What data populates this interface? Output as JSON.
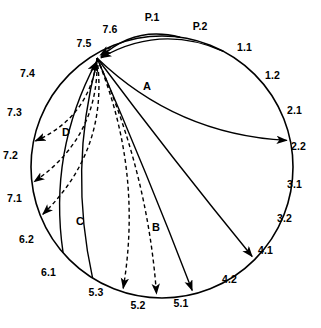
{
  "figure": {
    "type": "connection-circle-diagram",
    "stroke_color": "#000000",
    "background_color": "#ffffff"
  },
  "circle": {
    "cx": 162,
    "cy": 167,
    "r": 131
  },
  "hub": {
    "id": "7.5",
    "x": 97,
    "y": 58
  },
  "nodes": [
    {
      "id": "P.1",
      "label": "P.1",
      "angle": -82,
      "lx": 152,
      "ly": 17,
      "anchor": "mid"
    },
    {
      "id": "P.2",
      "label": "P.2",
      "angle": -62,
      "lx": 200,
      "ly": 26,
      "anchor": "mid"
    },
    {
      "id": "1.1",
      "label": "1.1",
      "angle": -42,
      "lx": 237,
      "ly": 47,
      "anchor": "start"
    },
    {
      "id": "1.2",
      "label": "1.2",
      "angle": -27,
      "lx": 265,
      "ly": 75,
      "anchor": "start"
    },
    {
      "id": "2.1",
      "label": "2.1",
      "angle": -11,
      "lx": 287,
      "ly": 110,
      "anchor": "start"
    },
    {
      "id": "2.2",
      "label": "2.2",
      "angle": 3,
      "lx": 291,
      "ly": 146,
      "anchor": "start"
    },
    {
      "id": "3.1",
      "label": "3.1",
      "angle": 17,
      "lx": 287,
      "ly": 184,
      "anchor": "start"
    },
    {
      "id": "3.2",
      "label": "3.2",
      "angle": 31,
      "lx": 277,
      "ly": 218,
      "anchor": "start"
    },
    {
      "id": "4.1",
      "label": "4.1",
      "angle": 45,
      "lx": 258,
      "ly": 250,
      "anchor": "start"
    },
    {
      "id": "4.2",
      "label": "4.2",
      "angle": 60,
      "lx": 222,
      "ly": 279,
      "anchor": "start"
    },
    {
      "id": "5.1",
      "label": "5.1",
      "angle": 76,
      "lx": 181,
      "ly": 303,
      "anchor": "mid"
    },
    {
      "id": "5.2",
      "label": "5.2",
      "angle": 92,
      "lx": 138,
      "ly": 305,
      "anchor": "mid"
    },
    {
      "id": "5.3",
      "label": "5.3",
      "angle": 107,
      "lx": 96,
      "ly": 292,
      "anchor": "mid"
    },
    {
      "id": "6.1",
      "label": "6.1",
      "angle": 122,
      "lx": 56,
      "ly": 272,
      "anchor": "end"
    },
    {
      "id": "6.2",
      "label": "6.2",
      "angle": 139,
      "lx": 34,
      "ly": 239,
      "anchor": "end"
    },
    {
      "id": "7.1",
      "label": "7.1",
      "angle": 157,
      "lx": 22,
      "ly": 198,
      "anchor": "end"
    },
    {
      "id": "7.2",
      "label": "7.2",
      "angle": 172,
      "lx": 18,
      "ly": 155,
      "anchor": "end"
    },
    {
      "id": "7.3",
      "label": "7.3",
      "angle": -170,
      "lx": 22,
      "ly": 112,
      "anchor": "end"
    },
    {
      "id": "7.4",
      "label": "7.4",
      "angle": -153,
      "lx": 35,
      "ly": 73,
      "anchor": "end"
    },
    {
      "id": "7.5",
      "label": "7.5",
      "angle": -140,
      "lx": 84,
      "ly": 43,
      "anchor": "mid"
    },
    {
      "id": "7.6",
      "label": "7.6",
      "angle": -113,
      "lx": 110,
      "ly": 29,
      "anchor": "mid"
    }
  ],
  "group_labels": [
    {
      "id": "A",
      "label": "A",
      "x": 147,
      "y": 87,
      "describes": "solid arcs from P.1 and P.2 into hub 7.5"
    },
    {
      "id": "B",
      "label": "B",
      "x": 156,
      "y": 228,
      "describes": "dashed arcs from hub 7.5 to 5.3 and 5.2"
    },
    {
      "id": "C",
      "label": "C",
      "x": 80,
      "y": 222,
      "describes": "solid arcs from 6.2 and 6.1 into hub 7.5"
    },
    {
      "id": "D",
      "label": "D",
      "x": 66,
      "y": 133,
      "describes": "dashed arcs from hub 7.5 to 7.3, 7.2 and 7.1"
    }
  ],
  "connections": [
    {
      "from": "P.1",
      "to": "7.5",
      "style": "solid",
      "arrow_at": "7.5",
      "group": "A"
    },
    {
      "from": "P.2",
      "to": "7.5",
      "style": "solid",
      "arrow_at": "7.5",
      "group": "A"
    },
    {
      "from": "7.5",
      "to": "2.1",
      "style": "solid",
      "arrow_at": "2.1",
      "group": ""
    },
    {
      "from": "7.5",
      "to": "4.1",
      "style": "solid",
      "arrow_at": "4.1",
      "group": ""
    },
    {
      "from": "7.5",
      "to": "5.1",
      "style": "solid",
      "arrow_at": "5.1",
      "group": ""
    },
    {
      "from": "7.5",
      "to": "5.2",
      "style": "dashed",
      "arrow_at": "5.2",
      "group": "B"
    },
    {
      "from": "7.5",
      "to": "5.3",
      "style": "dashed",
      "arrow_at": "5.3",
      "group": "B"
    },
    {
      "from": "6.1",
      "to": "7.5",
      "style": "solid",
      "arrow_at": "7.5",
      "group": "C"
    },
    {
      "from": "6.2",
      "to": "7.5",
      "style": "solid",
      "arrow_at": "7.5",
      "group": "C"
    },
    {
      "from": "7.5",
      "to": "7.1",
      "style": "dashed",
      "arrow_at": "7.1",
      "group": "D"
    },
    {
      "from": "7.5",
      "to": "7.2",
      "style": "dashed",
      "arrow_at": "7.2",
      "group": "D"
    },
    {
      "from": "7.5",
      "to": "7.3",
      "style": "dashed",
      "arrow_at": "7.3",
      "group": "D"
    },
    {
      "from": "7.6",
      "to": "7.5",
      "style": "dashed",
      "arrow_at": "7.5",
      "group": "D"
    }
  ]
}
